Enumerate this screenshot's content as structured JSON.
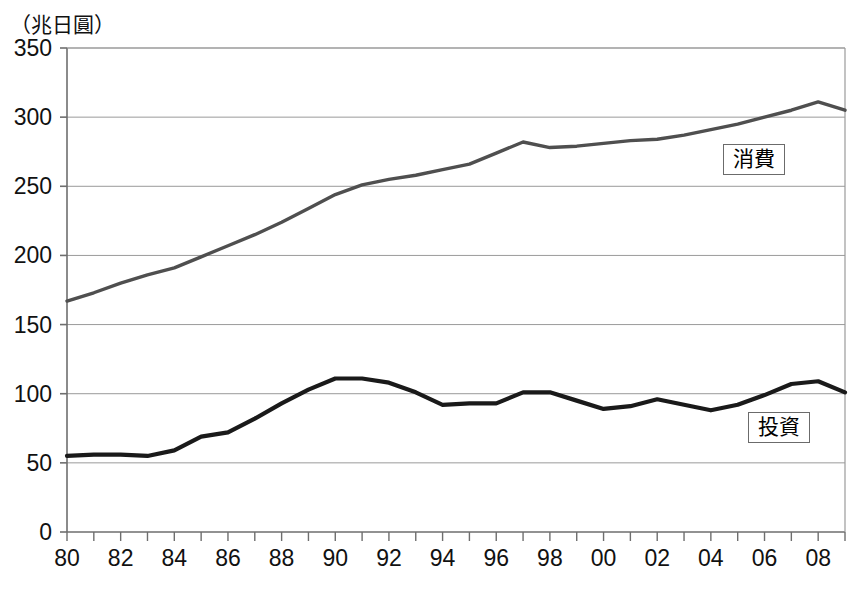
{
  "chart_data": {
    "type": "line",
    "title": "",
    "subtitle": "",
    "unit_label": "（兆日圓）",
    "xlabel": "",
    "ylabel": "",
    "ylim": [
      0,
      350
    ],
    "xlim": [
      1980,
      2009
    ],
    "grid": true,
    "y_ticks": [
      0,
      50,
      100,
      150,
      200,
      250,
      300,
      350
    ],
    "y_tick_labels": [
      "0",
      "50",
      "100",
      "150",
      "200",
      "250",
      "300",
      "350"
    ],
    "x_ticks": [
      1980,
      1982,
      1984,
      1986,
      1988,
      1990,
      1992,
      1994,
      1996,
      1998,
      2000,
      2002,
      2004,
      2006,
      2008
    ],
    "x_tick_labels": [
      "80",
      "82",
      "84",
      "86",
      "88",
      "90",
      "92",
      "94",
      "96",
      "98",
      "00",
      "02",
      "04",
      "06",
      "08"
    ],
    "x": [
      1980,
      1981,
      1982,
      1983,
      1984,
      1985,
      1986,
      1987,
      1988,
      1989,
      1990,
      1991,
      1992,
      1993,
      1994,
      1995,
      1996,
      1997,
      1998,
      1999,
      2000,
      2001,
      2002,
      2003,
      2004,
      2005,
      2006,
      2007,
      2008,
      2009
    ],
    "legend_position": "inside-right",
    "series": [
      {
        "name": "消費",
        "label": "消費",
        "color": "#4f4f4f",
        "values": [
          167,
          173,
          180,
          186,
          191,
          199,
          207,
          215,
          224,
          234,
          244,
          251,
          255,
          258,
          262,
          266,
          274,
          282,
          278,
          279,
          281,
          283,
          284,
          287,
          291,
          295,
          300,
          305,
          311,
          305
        ]
      },
      {
        "name": "投資",
        "label": "投資",
        "color": "#1a1a1a",
        "values": [
          55,
          56,
          56,
          55,
          59,
          69,
          72,
          82,
          93,
          103,
          111,
          111,
          108,
          101,
          92,
          93,
          93,
          101,
          101,
          95,
          89,
          91,
          96,
          92,
          88,
          92,
          99,
          107,
          109,
          101
        ]
      }
    ],
    "annotations": []
  },
  "legend": {
    "consumption": "消費",
    "investment": "投資"
  },
  "axis": {
    "unit": "（兆日圓）"
  }
}
